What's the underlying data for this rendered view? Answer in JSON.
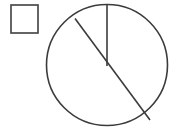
{
  "figure": {
    "background_color": "#ffffff",
    "stroke_color": "#3b3b3b",
    "canvas": {
      "width": 170,
      "height": 128
    },
    "shapes": [
      {
        "name": "square",
        "type": "rect",
        "label": "empty square outline",
        "x": 11,
        "y": 5,
        "width": 27,
        "height": 28,
        "fill": "#ffffff",
        "stroke": "#4a4a4a",
        "stroke_width": 1.7
      },
      {
        "name": "circle",
        "type": "circle",
        "label": "circle outline",
        "cx": 107,
        "cy": 65,
        "r": 60.5,
        "fill": "none",
        "stroke": "#3b3b3b",
        "stroke_width": 1.6
      },
      {
        "name": "radius-line",
        "type": "line",
        "label": "vertical radius from top of circle to center",
        "x1": 107,
        "y1": 4.5,
        "x2": 107,
        "y2": 66,
        "stroke": "#3b3b3b",
        "stroke_width": 1.6
      },
      {
        "name": "chord-line",
        "type": "line",
        "label": "diagonal chord from upper-left to lower-right of circle",
        "x1": 75,
        "y1": 18.5,
        "x2": 150,
        "y2": 120,
        "stroke": "#3b3b3b",
        "stroke_width": 1.6
      }
    ]
  }
}
